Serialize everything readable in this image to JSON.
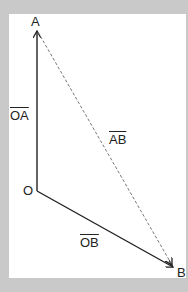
{
  "diagram": {
    "background_color": "#c9c9c9",
    "card_color": "#ffffff",
    "points": {
      "O": {
        "label": "O",
        "x": 37,
        "y": 191
      },
      "A": {
        "label": "A",
        "x": 37,
        "y": 30
      },
      "B": {
        "label": "B",
        "x": 174,
        "y": 268
      }
    },
    "vectors": [
      {
        "id": "OA",
        "label": "OA",
        "from": "O",
        "to": "A",
        "style": "solid",
        "color": "#222222"
      },
      {
        "id": "OB",
        "label": "OB",
        "from": "O",
        "to": "B",
        "style": "solid",
        "color": "#222222"
      },
      {
        "id": "AB",
        "label": "AB",
        "from": "A",
        "to": "B",
        "style": "dashed",
        "color": "#777777"
      }
    ]
  }
}
